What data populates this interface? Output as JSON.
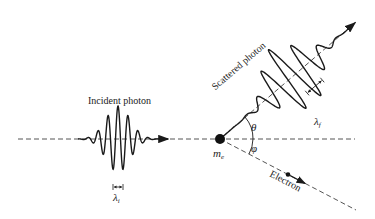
{
  "diagram": {
    "type": "Compton scattering",
    "labels": {
      "incident": "Incident photon",
      "scattered": "Scattered photon",
      "electron": "Electron",
      "electron_mass": "m",
      "electron_mass_sub": "e",
      "theta": "θ",
      "phi": "φ",
      "lambda_i": "λ",
      "lambda_i_sub": "i",
      "lambda_f": "λ",
      "lambda_f_sub": "f"
    },
    "colors": {
      "ink": "#1a1a1a",
      "dash": "#555555",
      "background": "#ffffff"
    }
  }
}
